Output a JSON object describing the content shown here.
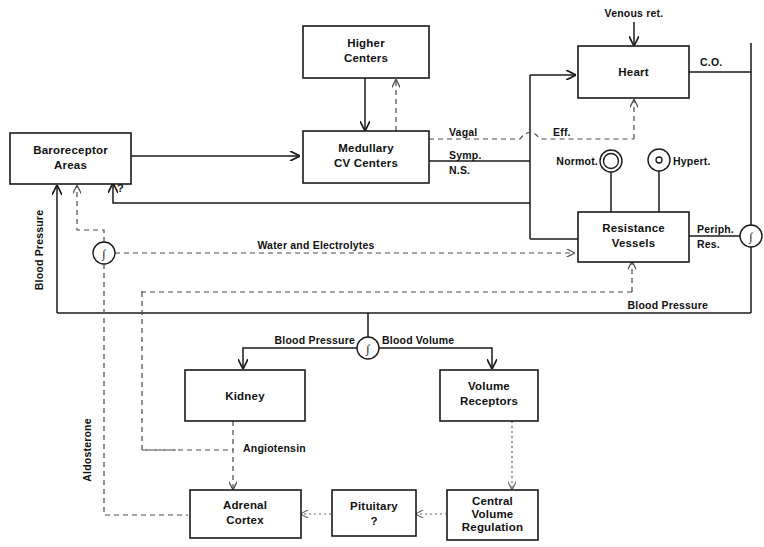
{
  "diagram": {
    "boxes": [
      {
        "id": "baroreceptor-areas",
        "lines": [
          "Baroreceptor",
          "Areas"
        ]
      },
      {
        "id": "higher-centers",
        "lines": [
          "Higher",
          "Centers"
        ]
      },
      {
        "id": "medullary-cv-centers",
        "lines": [
          "Medullary",
          "CV Centers"
        ]
      },
      {
        "id": "heart",
        "lines": [
          "Heart"
        ]
      },
      {
        "id": "resistance-vessels",
        "lines": [
          "Resistance",
          "Vessels"
        ]
      },
      {
        "id": "kidney",
        "lines": [
          "Kidney"
        ]
      },
      {
        "id": "volume-receptors",
        "lines": [
          "Volume",
          "Receptors"
        ]
      },
      {
        "id": "adrenal-cortex",
        "lines": [
          "Adrenal",
          "Cortex"
        ]
      },
      {
        "id": "pituitary",
        "lines": [
          "Pituitary",
          "?"
        ]
      },
      {
        "id": "central-volume-regulation",
        "lines": [
          "Central",
          "Volume",
          "Regulation"
        ]
      }
    ],
    "labels": {
      "venous_return": "Venous ret.",
      "cardiac_output": "C.O.",
      "vagal": "Vagal",
      "symp": "Symp.",
      "ns": "N.S.",
      "eff": "Eff.",
      "normotensive": "Normot.",
      "hypertensive": "Hypert.",
      "peripheral": "Periph.",
      "resistance": "Res.",
      "water_and_electrolytes": "Water and Electrolytes",
      "blood_pressure_vertical": "Blood Pressure",
      "blood_pressure_lower_right": "Blood Pressure",
      "blood_pressure_center": "Blood Pressure",
      "blood_volume": "Blood Volume",
      "aldosterone": "Aldosterone",
      "angiotensin": "Angiotensin",
      "question_mark": "?"
    },
    "symbols": {
      "integrator": "∫",
      "normotensive_marker": "double-ring",
      "hypertensive_marker": "ring-with-dot"
    },
    "colors": {
      "stroke": "#1a1a1a",
      "dashed_stroke": "#4a4a4a",
      "dotted_stroke": "#6a6a6a",
      "text": "#111111",
      "background": "#ffffff"
    }
  }
}
